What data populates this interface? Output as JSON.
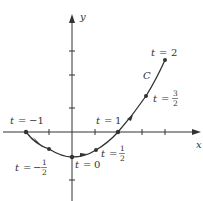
{
  "axes": {
    "x_label": "x",
    "y_label": "y"
  },
  "curve": {
    "name": "C",
    "color": "#333333",
    "points": [
      {
        "t": "-1",
        "px": 26,
        "py": 132
      },
      {
        "t": "-1/2",
        "px": 49,
        "py": 149
      },
      {
        "t": "0",
        "px": 72,
        "py": 157
      },
      {
        "t": "1/2",
        "px": 96,
        "py": 150
      },
      {
        "t": "1",
        "px": 118,
        "py": 132
      },
      {
        "t": "3/2",
        "px": 146,
        "py": 96
      },
      {
        "t": "2",
        "px": 165,
        "py": 60
      }
    ]
  },
  "labels": {
    "t_var": "t",
    "eq": "=",
    "t_neg1": "−1",
    "t_neghalf_sign": "−",
    "t_zero": "0",
    "t_one": "1",
    "t_two": "2",
    "half_num": "1",
    "half_den": "2",
    "threehalf_num": "3",
    "threehalf_den": "2"
  }
}
